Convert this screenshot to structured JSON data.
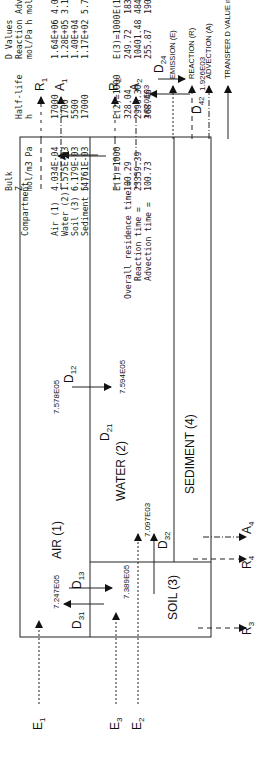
{
  "diagram": {
    "compartments": [
      {
        "id": 1,
        "label": "AIR (1)"
      },
      {
        "id": 2,
        "label": "WATER (2)"
      },
      {
        "id": 3,
        "label": "SOIL (3)"
      },
      {
        "id": 4,
        "label": "SEDIMENT (4)"
      }
    ],
    "emissions": [
      {
        "label": "E",
        "sub": "1"
      },
      {
        "label": "E",
        "sub": "2"
      },
      {
        "label": "E",
        "sub": "3"
      }
    ],
    "reactions": [
      {
        "label": "R",
        "sub": "1"
      },
      {
        "label": "R",
        "sub": "2"
      },
      {
        "label": "R",
        "sub": "3"
      },
      {
        "label": "R",
        "sub": "4"
      }
    ],
    "advections": [
      {
        "label": "A",
        "sub": "1"
      },
      {
        "label": "A",
        "sub": "2"
      },
      {
        "label": "A",
        "sub": "4"
      }
    ],
    "transfers": [
      {
        "label": "D",
        "sub": "12",
        "value": "7.594E05"
      },
      {
        "label": "D",
        "sub": "21",
        "value": "7.578E05"
      },
      {
        "label": "D",
        "sub": "13",
        "value": "7.389E05"
      },
      {
        "label": "D",
        "sub": "31",
        "value": "7.247E05"
      },
      {
        "label": "D",
        "sub": "32",
        "value": "7.097E03"
      },
      {
        "label": "D",
        "sub": "24",
        "value": "1.926E03"
      },
      {
        "label": "D",
        "sub": "42",
        "value": "1.620E03"
      }
    ]
  },
  "legend": {
    "items": [
      {
        "style": "dotted",
        "label": "EMISSION (E)"
      },
      {
        "style": "dashed",
        "label": "REACTION (R)"
      },
      {
        "style": "dash-dot",
        "label": "ADVECTION (A)"
      },
      {
        "style": "solid",
        "label": "TRANSFER D VALUE mol/Pa h"
      }
    ]
  },
  "table": {
    "group_header": "D Values",
    "headers": {
      "compartment": "Compartment",
      "z": [
        "Bulk",
        "Z",
        "mol/m3 Pa"
      ],
      "halflife": [
        "Half-life",
        "h"
      ],
      "reaction": [
        "Reaction",
        "mol/Pa h"
      ],
      "advection": [
        "Advection",
        "mol/Pa h"
      ]
    },
    "rows": [
      {
        "name": "Air (1)",
        "z": "4.034E-04",
        "halflife": "17000",
        "reaction": "1.64E+06",
        "advection": "4.03E+08"
      },
      {
        "name": "Water (2)",
        "z": "1.575E-03",
        "halflife": "1700",
        "reaction": "1.28E+05",
        "advection": "3.15E+05"
      },
      {
        "name": "Soil (3)",
        "z": "6.179E-03",
        "halflife": "5500",
        "reaction": "1.40E+04",
        "advection": ""
      },
      {
        "name": "Sediment (4)",
        "z": "5.761E-03",
        "halflife": "17000",
        "reaction": "1.17E+02",
        "advection": "5.76E+01"
      }
    ]
  },
  "residence": {
    "headers": [
      "E(1)=1000",
      "E(2)=1000",
      "E(3)=1000",
      "E(1,2,3)"
    ],
    "rows": [
      {
        "label": "Overall residence time =",
        "values": [
          "100.29",
          "328.04",
          "249.72",
          "183.56 h"
        ]
      },
      {
        "label": "Reaction time =",
        "values": [
          "23359.39",
          "2990.30",
          "10401.48",
          "4844.89 h"
        ]
      },
      {
        "label": "Advection time =",
        "values": [
          "100.73",
          "368.46",
          "255.87",
          "190.79 h"
        ]
      }
    ]
  }
}
